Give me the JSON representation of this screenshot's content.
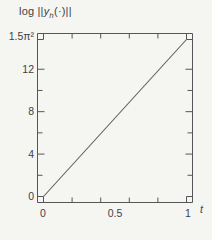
{
  "title": {
    "prefix": "log ||",
    "variable": "y",
    "subscript": "h",
    "suffix": "(·)||"
  },
  "x_axis": {
    "label": "t",
    "tick_labels": [
      "0",
      "0.5",
      "1"
    ]
  },
  "y_axis": {
    "tick_labels": [
      "0",
      "4",
      "8",
      "12",
      "1.5π²"
    ]
  },
  "colors": {
    "background": "#f5f5f2",
    "axis": "#55565a",
    "line": "#5c5d5f",
    "text": "#414244"
  },
  "chart_data": {
    "type": "line",
    "xlabel": "t",
    "ylabel": "log ||y_h(·)||",
    "x": [
      0,
      1
    ],
    "y": [
      0,
      14.804
    ],
    "xlim": [
      0,
      1
    ],
    "ylim": [
      0,
      14.804
    ],
    "x_ticks_labeled": [
      0,
      0.5,
      1
    ],
    "x_ticks_minor": [
      0.2,
      0.4,
      0.6,
      0.8
    ],
    "y_ticks_labeled": [
      0,
      4,
      8,
      12,
      14.804
    ],
    "y_tick_top_label": "1.5π²",
    "y_ticks_minor": [
      2,
      6,
      10
    ],
    "grid": false,
    "legend": false,
    "series": [
      {
        "name": "log ||y_h(·)||",
        "x": [
          0,
          1
        ],
        "y": [
          0,
          14.804
        ]
      }
    ]
  }
}
